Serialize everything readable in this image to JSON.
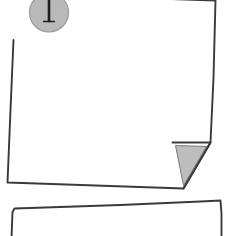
{
  "illustration": {
    "title": "Pinned paper note with folded corner",
    "subject": "hand-drawn blank sheet of paper held by a push pin, with a second sheet beginning below",
    "style": "line drawing, sketch, monochrome",
    "canvas": {
      "width": 228,
      "height": 236,
      "background_color": "#ffffff"
    }
  },
  "palette": {
    "paper_fill": "#ffffff",
    "outline_stroke": "#3a3a3a",
    "pin_head_fill": "#b9b9b9",
    "pin_head_stroke": "#9a9a9a",
    "pin_needle_stroke": "#1e1e1e",
    "fold_shadow_fill": "#bdbdbd",
    "fold_shadow_stroke": "#7a7a7a"
  },
  "objects": {
    "front_sheet": {
      "label": "Front sheet of paper",
      "outline_points": "15.5,-6 215.5,0.5 213.5,78 210.5,142.5 183.5,188.5 7.5,182.5 10.5,110 13.5,40",
      "stroke_width": 1.9,
      "fill": "#ffffff",
      "cropped_at_top": true
    },
    "folded_corner": {
      "label": "Turned-up bottom-right corner",
      "shadow_points": "175.5,145.5 206.5,146.5 183.5,185.5",
      "crease_points": "172.5,142.5 210.5,142.5 183.5,188.5",
      "stroke_width": 1.9
    },
    "push_pin": {
      "label": "Push pin holding the sheet",
      "head": {
        "cx": 49,
        "cy": 12.5,
        "r": 19.5,
        "fill": "#b9b9b9",
        "stroke": "#9a9a9a",
        "stroke_width": 1.2
      },
      "needle": {
        "x": 49,
        "y_top": -8,
        "y_bottom": 21,
        "stroke_width": 2.6
      },
      "needle_tip": {
        "x_left": 43.5,
        "x_right": 54.5,
        "y": 21.5,
        "stroke_width": 1.4
      }
    },
    "back_sheet": {
      "label": "Second sheet of paper beginning below",
      "outline_points": "11.5,238 12.5,212 14.5,208.5 120.5,205 200.5,201.5 220.5,200.5 221.5,214 221.5,238",
      "stroke_width": 1.9,
      "fill": "#ffffff",
      "cropped_at_bottom": true
    }
  }
}
